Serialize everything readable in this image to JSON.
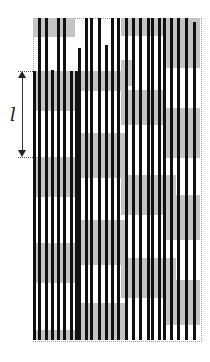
{
  "figure": {
    "dimension_label": "l",
    "colors": {
      "block": "#c4c4c4",
      "bar": "#111111",
      "frame": "#9a9a9a"
    },
    "frame": {
      "x": 33,
      "y": 18,
      "w": 167,
      "h": 322
    },
    "dimension": {
      "x": 22,
      "y_top": 71,
      "y_bottom": 157,
      "label_x": 10,
      "label_y": 104
    },
    "blocks": [
      {
        "x": 33,
        "y": 18,
        "w": 42,
        "h": 19
      },
      {
        "x": 33,
        "y": 71,
        "w": 42,
        "h": 40
      },
      {
        "x": 33,
        "y": 157,
        "w": 42,
        "h": 40
      },
      {
        "x": 33,
        "y": 243,
        "w": 42,
        "h": 40
      },
      {
        "x": 33,
        "y": 330,
        "w": 42,
        "h": 10
      },
      {
        "x": 75,
        "y": 18,
        "w": 50,
        "h": 0
      },
      {
        "x": 75,
        "y": 71,
        "w": 50,
        "h": 20
      },
      {
        "x": 75,
        "y": 133,
        "w": 50,
        "h": 45
      },
      {
        "x": 75,
        "y": 220,
        "w": 50,
        "h": 45
      },
      {
        "x": 75,
        "y": 303,
        "w": 50,
        "h": 37
      },
      {
        "x": 121,
        "y": 18,
        "w": 55,
        "h": 18
      },
      {
        "x": 121,
        "y": 60,
        "w": 14,
        "h": 26
      },
      {
        "x": 121,
        "y": 90,
        "w": 45,
        "h": 35
      },
      {
        "x": 121,
        "y": 175,
        "w": 55,
        "h": 40
      },
      {
        "x": 121,
        "y": 258,
        "w": 55,
        "h": 40
      },
      {
        "x": 166,
        "y": 18,
        "w": 34,
        "h": 50
      },
      {
        "x": 166,
        "y": 108,
        "w": 34,
        "h": 50
      },
      {
        "x": 166,
        "y": 195,
        "w": 34,
        "h": 45
      },
      {
        "x": 166,
        "y": 280,
        "w": 34,
        "h": 45
      }
    ],
    "bars": [
      {
        "x": 33,
        "y1": 71,
        "y2": 340
      },
      {
        "x": 38,
        "y1": 18,
        "y2": 340
      },
      {
        "x": 45,
        "y1": 18,
        "y2": 340
      },
      {
        "x": 51,
        "y1": 70,
        "y2": 340
      },
      {
        "x": 57,
        "y1": 18,
        "y2": 340
      },
      {
        "x": 63,
        "y1": 18,
        "y2": 340
      },
      {
        "x": 70,
        "y1": 71,
        "y2": 340
      },
      {
        "x": 75,
        "y1": 71,
        "y2": 340
      },
      {
        "x": 78,
        "y1": 48,
        "y2": 340
      },
      {
        "x": 85,
        "y1": 18,
        "y2": 340
      },
      {
        "x": 90,
        "y1": 18,
        "y2": 340
      },
      {
        "x": 98,
        "y1": 18,
        "y2": 340
      },
      {
        "x": 105,
        "y1": 45,
        "y2": 340
      },
      {
        "x": 111,
        "y1": 18,
        "y2": 340
      },
      {
        "x": 117,
        "y1": 18,
        "y2": 340
      },
      {
        "x": 125,
        "y1": 18,
        "y2": 340
      },
      {
        "x": 132,
        "y1": 18,
        "y2": 340
      },
      {
        "x": 139,
        "y1": 18,
        "y2": 340
      },
      {
        "x": 147,
        "y1": 18,
        "y2": 340
      },
      {
        "x": 151,
        "y1": 18,
        "y2": 340
      },
      {
        "x": 158,
        "y1": 18,
        "y2": 340
      },
      {
        "x": 163,
        "y1": 18,
        "y2": 340
      },
      {
        "x": 170,
        "y1": 18,
        "y2": 340
      },
      {
        "x": 177,
        "y1": 18,
        "y2": 340
      },
      {
        "x": 185,
        "y1": 18,
        "y2": 340
      },
      {
        "x": 193,
        "y1": 22,
        "y2": 340
      }
    ]
  }
}
